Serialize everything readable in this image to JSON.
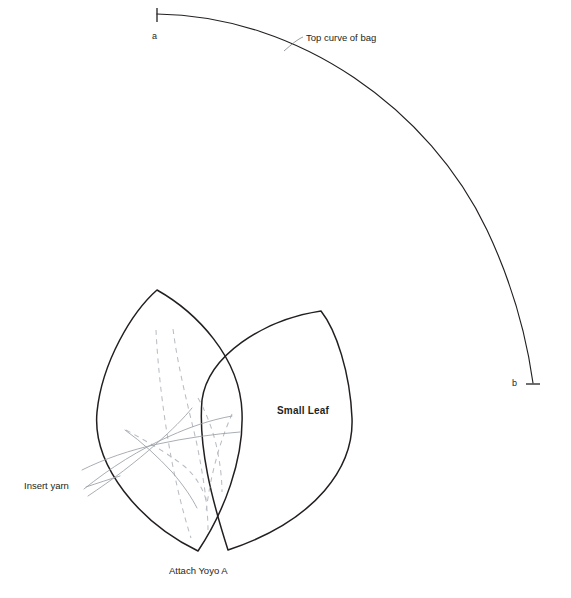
{
  "diagram": {
    "background_color": "#ffffff",
    "ink_color": "#231f20",
    "guide_color": "#b9bdc4",
    "yarn_color": "#9a9fa6",
    "labels": {
      "top_curve_of_bag": "Top curve of bag",
      "point_a": "a",
      "point_b": "b",
      "small_leaf": "Small Leaf",
      "insert_yarn": "Insert yarn",
      "attach_yoyo_a": "Attach Yoyo A"
    },
    "annotations": {
      "arc_endpoint_a": "a",
      "arc_endpoint_b": "b",
      "leader_line": "leader from arc to Top curve of bag label"
    },
    "shapes": {
      "top_arc": {
        "name": "top curve of bag",
        "from": "a",
        "to": "b",
        "style": "solid"
      },
      "left_leaf": {
        "name": "large leaf outline",
        "style": "solid"
      },
      "right_leaf": {
        "name": "Small Leaf outline",
        "style": "solid"
      },
      "dashed_guides": {
        "name": "stitch guide lines",
        "style": "dashed",
        "count": 5
      },
      "yarn_strands": {
        "name": "inserted yarn strands",
        "style": "solid thin",
        "count": 4
      }
    }
  }
}
